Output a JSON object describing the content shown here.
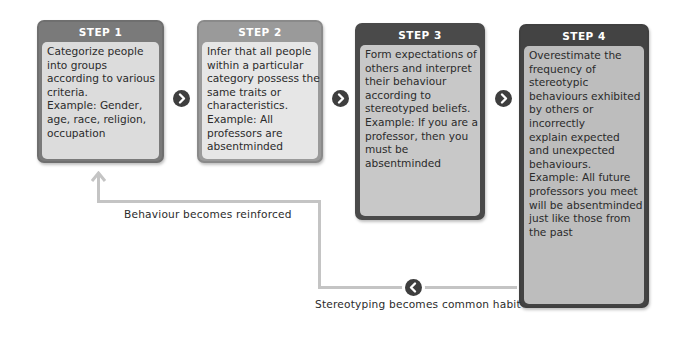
{
  "diagram": {
    "steps": [
      {
        "title": "STEP 1",
        "lines": [
          "Categorize people",
          "into groups",
          "according to various",
          "criteria.",
          "Example: Gender,",
          "age, race, religion,",
          "occupation"
        ],
        "colors": {
          "header": "#7a7a7a",
          "body": "#dcdcdc",
          "border": "#6f6f6f"
        }
      },
      {
        "title": "STEP 2",
        "lines": [
          "Infer that all people",
          "within a particular",
          "category possess the",
          "same traits or",
          "characteristics.",
          "Example:  All",
          "professors are",
          "absentminded"
        ],
        "colors": {
          "header": "#9a9a9a",
          "body": "#e6e6e6",
          "border": "#8a8a8a"
        }
      },
      {
        "title": "STEP 3",
        "lines": [
          "Form expectations of",
          "others and interpret",
          "their behaviour",
          "according to",
          "stereotyped beliefs.",
          "Example: If you are a",
          "professor, then you",
          "must be",
          "absentminded"
        ],
        "colors": {
          "header": "#4a4a4a",
          "body": "#c8c8c8",
          "border": "#4a4a4a"
        }
      },
      {
        "title": "STEP 4",
        "lines": [
          "Overestimate the",
          "frequency of",
          "stereotypic",
          "behaviours exhibited",
          "by others or",
          "incorrectly",
          "explain expected",
          "and unexpected",
          "behaviours.",
          "Example:  All future",
          "professors you meet",
          "will be absentminded",
          "just like those from",
          "the past"
        ],
        "colors": {
          "header": "#434343",
          "body": "#bdbdbd",
          "border": "#404040"
        }
      }
    ],
    "arrows": [
      {
        "icon": "chevron-right-circle-icon",
        "from": "STEP 1",
        "to": "STEP 2"
      },
      {
        "icon": "chevron-right-circle-icon",
        "from": "STEP 2",
        "to": "STEP 3"
      },
      {
        "icon": "chevron-right-circle-icon",
        "from": "STEP 3",
        "to": "STEP 4"
      }
    ],
    "feedback": {
      "reinforced_label": "Behaviour becomes reinforced",
      "habit_label": "Stereotyping becomes common habit",
      "return_icon": "chevron-left-circle-icon",
      "up_arrow_icon": "arrow-up-icon",
      "line_color": "#c4c4c4"
    }
  }
}
